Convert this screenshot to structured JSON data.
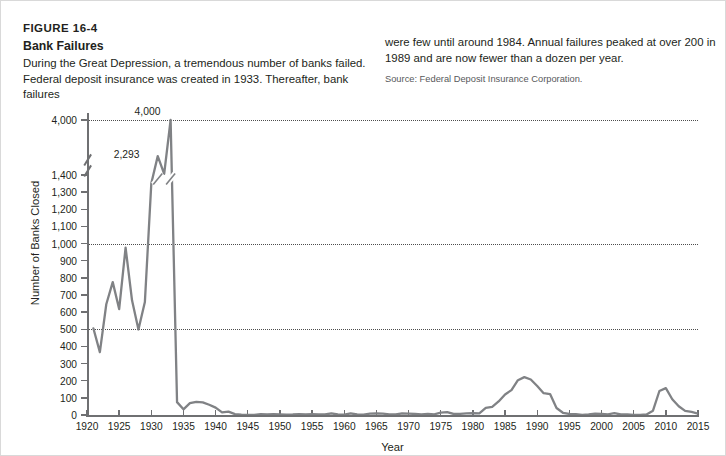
{
  "figure": {
    "number": "FIGURE 16-4",
    "title": "Bank Failures",
    "body_left": "During the Great Depression, a tremendous number of banks failed. Federal deposit insurance was created in 1933. Thereafter, bank failures",
    "body_right": "were few until around 1984. Annual failures peaked at over 200 in 1989 and are now fewer than a dozen per year.",
    "source": "Source: Federal Deposit Insurance Corporation."
  },
  "colors": {
    "line": "#808285",
    "axis": "#6f7072",
    "grid": "#4d4d4d",
    "text": "#231f20",
    "border": "#d9d9d9",
    "background": "#ffffff"
  },
  "chart_data": {
    "type": "line",
    "title": "Bank Failures",
    "xlabel": "Year",
    "ylabel": "Number of Banks Closed",
    "xlim": [
      1920,
      2015
    ],
    "ylim": [
      0,
      1400
    ],
    "y_axis_break": true,
    "y_break_between": [
      1400,
      4000
    ],
    "y_top_value": 4000,
    "grid": "horizontal-dotted",
    "gridlines": [
      500,
      1000,
      4000
    ],
    "legend": "none",
    "xticks": [
      1920,
      1925,
      1930,
      1935,
      1940,
      1945,
      1950,
      1955,
      1960,
      1965,
      1970,
      1975,
      1980,
      1985,
      1990,
      1995,
      2000,
      2005,
      2010,
      2015
    ],
    "yticks": [
      0,
      100,
      200,
      300,
      400,
      500,
      600,
      700,
      800,
      900,
      1000,
      1100,
      1200,
      1300,
      1400,
      4000
    ],
    "ytick_labels": [
      "0",
      "100",
      "200",
      "300",
      "400",
      "500",
      "600",
      "700",
      "800",
      "900",
      "1,000",
      "1,100",
      "1,200",
      "1,300",
      "1,400",
      "4,000"
    ],
    "annotations": [
      {
        "label": "4,000",
        "x": 1933,
        "y": 4000
      },
      {
        "label": "2,293",
        "x": 1931,
        "y": 2293
      }
    ],
    "series": [
      {
        "name": "Number of Banks Closed",
        "x": [
          1921,
          1922,
          1923,
          1924,
          1925,
          1926,
          1927,
          1928,
          1929,
          1930,
          1931,
          1932,
          1933,
          1934,
          1935,
          1936,
          1937,
          1938,
          1939,
          1940,
          1941,
          1942,
          1943,
          1944,
          1945,
          1946,
          1947,
          1948,
          1949,
          1950,
          1951,
          1952,
          1953,
          1954,
          1955,
          1956,
          1957,
          1958,
          1959,
          1960,
          1961,
          1962,
          1963,
          1964,
          1965,
          1966,
          1967,
          1968,
          1969,
          1970,
          1971,
          1972,
          1973,
          1974,
          1975,
          1976,
          1977,
          1978,
          1979,
          1980,
          1981,
          1982,
          1983,
          1984,
          1985,
          1986,
          1987,
          1988,
          1989,
          1990,
          1991,
          1992,
          1993,
          1994,
          1995,
          1996,
          1997,
          1998,
          1999,
          2000,
          2001,
          2002,
          2003,
          2004,
          2005,
          2006,
          2007,
          2008,
          2009,
          2010,
          2011,
          2012,
          2013,
          2014,
          2015
        ],
        "y": [
          505,
          367,
          646,
          775,
          618,
          976,
          669,
          499,
          659,
          1352,
          2293,
          1456,
          4000,
          75,
          33,
          69,
          77,
          74,
          60,
          43,
          15,
          20,
          5,
          2,
          1,
          1,
          5,
          3,
          5,
          4,
          2,
          3,
          5,
          4,
          5,
          3,
          3,
          9,
          3,
          2,
          9,
          3,
          2,
          8,
          9,
          8,
          4,
          3,
          9,
          8,
          6,
          3,
          6,
          4,
          14,
          17,
          6,
          7,
          10,
          11,
          10,
          42,
          48,
          79,
          120,
          145,
          203,
          221,
          207,
          169,
          127,
          122,
          41,
          13,
          6,
          5,
          1,
          3,
          8,
          7,
          4,
          11,
          3,
          4,
          0,
          0,
          3,
          25,
          140,
          157,
          92,
          51,
          24,
          18,
          8
        ]
      }
    ]
  }
}
